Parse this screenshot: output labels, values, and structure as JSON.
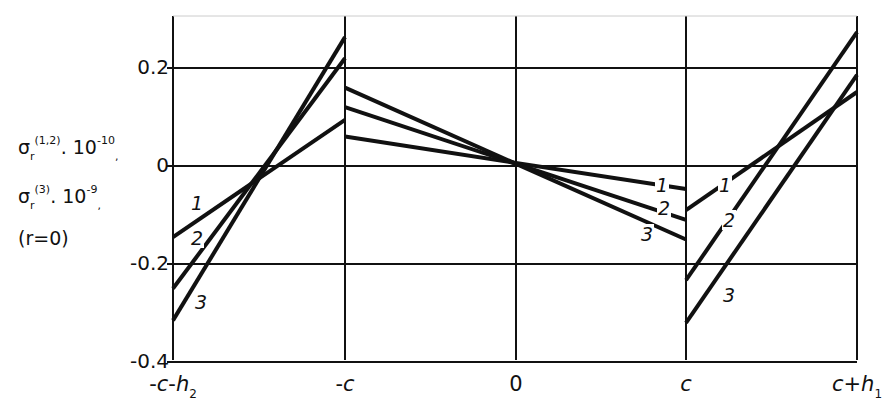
{
  "chart_data": {
    "type": "line",
    "title": "",
    "xlabel": "",
    "ylabel": "σ_r^(1,2)·10^-10, σ_r^(3)·10^-9 (r=0)",
    "ylabel_lines": [
      "σ",
      "σ",
      "(r=0)"
    ],
    "ylabel_parts": {
      "line1": {
        "sym": "σ",
        "sub": "r",
        "sup": "(1,2)",
        "factor": ". 10",
        "exp": "-10",
        "tail": ","
      },
      "line2": {
        "sym": "σ",
        "sub": "r",
        "sup": "(3)",
        "factor": ". 10",
        "exp": "-9",
        "tail": ","
      },
      "line3": "(r=0)"
    },
    "x_ticks": [
      "-c-h2",
      "-c",
      "0",
      "c",
      "c+h1"
    ],
    "x_tick_parts": [
      {
        "main": "-c-h",
        "sub": "2"
      },
      {
        "main": "-c",
        "sub": ""
      },
      {
        "main": "0",
        "sub": ""
      },
      {
        "main": "c",
        "sub": ""
      },
      {
        "main": "c+h",
        "sub": "1"
      }
    ],
    "y_ticks": [
      "0.2",
      "0",
      "-0.2",
      "-0.4"
    ],
    "ylim": [
      -0.4,
      0.3
    ],
    "grid": true,
    "legend": "inline curve labels 1, 2, 3",
    "series": [
      {
        "name": "1",
        "segments": [
          {
            "x": [
              "-c-h2",
              "-c"
            ],
            "y": [
              -0.145,
              0.094
            ]
          },
          {
            "x": [
              "-c",
              "c"
            ],
            "y": [
              0.06,
              -0.047
            ]
          },
          {
            "x": [
              "c",
              "c+h1"
            ],
            "y": [
              -0.09,
              0.151
            ]
          }
        ]
      },
      {
        "name": "2",
        "segments": [
          {
            "x": [
              "-c-h2",
              "-c"
            ],
            "y": [
              -0.25,
              0.22
            ]
          },
          {
            "x": [
              "-c",
              "c"
            ],
            "y": [
              0.12,
              -0.11
            ]
          },
          {
            "x": [
              "c",
              "c+h1"
            ],
            "y": [
              -0.233,
              0.273
            ]
          }
        ]
      },
      {
        "name": "3",
        "segments": [
          {
            "x": [
              "-c-h2",
              "-c"
            ],
            "y": [
              -0.315,
              0.263
            ]
          },
          {
            "x": [
              "-c",
              "c"
            ],
            "y": [
              0.16,
              -0.15
            ]
          },
          {
            "x": [
              "c",
              "c+h1"
            ],
            "y": [
              -0.32,
              0.186
            ]
          }
        ]
      }
    ]
  },
  "labels": {
    "curve_labels": [
      {
        "text": "1",
        "left": 190,
        "top": 193
      },
      {
        "text": "2",
        "left": 190,
        "top": 228
      },
      {
        "text": "3",
        "left": 194,
        "top": 292
      },
      {
        "text": "1",
        "left": 655,
        "top": 175
      },
      {
        "text": "2",
        "left": 657,
        "top": 198
      },
      {
        "text": "3",
        "left": 640,
        "top": 224
      },
      {
        "text": "1",
        "left": 718,
        "top": 175
      },
      {
        "text": "2",
        "left": 722,
        "top": 210
      },
      {
        "text": "3",
        "left": 722,
        "top": 285
      }
    ]
  }
}
